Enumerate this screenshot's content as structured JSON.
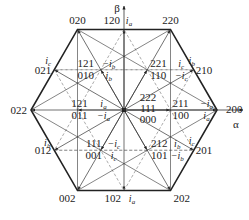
{
  "axes": {
    "alpha": "α",
    "beta": "β"
  },
  "colors": {
    "line": "#333333",
    "dashed": "#888888",
    "hexagon": "#222222"
  },
  "center_states": [
    "222",
    "111",
    "000"
  ],
  "large_vectors": [
    {
      "state": "200",
      "angle_deg": 0
    },
    {
      "state": "220",
      "angle_deg": 60
    },
    {
      "state": "020",
      "angle_deg": 120
    },
    {
      "state": "022",
      "angle_deg": 180
    },
    {
      "state": "002",
      "angle_deg": 240
    },
    {
      "state": "202",
      "angle_deg": 300
    }
  ],
  "medium_vectors": [
    {
      "state": "210",
      "angle_deg": 30,
      "current": "i",
      "current_sub": "b"
    },
    {
      "state": "120",
      "angle_deg": 90,
      "current": "i",
      "current_sub": "a"
    },
    {
      "state": "021",
      "angle_deg": 150,
      "current": "i",
      "current_sub": "c"
    },
    {
      "state": "012",
      "angle_deg": 210,
      "current": "i",
      "current_sub": "b"
    },
    {
      "state": "102",
      "angle_deg": 270,
      "current": "i",
      "current_sub": "a"
    },
    {
      "state": "201",
      "angle_deg": 330,
      "current": "i",
      "current_sub": "c"
    }
  ],
  "small_vectors": [
    {
      "top": "211",
      "bottom": "100",
      "angle_deg": 0,
      "top_current": "−i",
      "top_sub": "a",
      "bottom_current": "i",
      "bottom_sub": "a"
    },
    {
      "top": "221",
      "bottom": "110",
      "angle_deg": 60,
      "top_current": "i",
      "top_sub": "c",
      "bottom_current": "−i",
      "bottom_sub": "c"
    },
    {
      "top": "121",
      "bottom": "010",
      "angle_deg": 120,
      "top_current": "−i",
      "top_sub": "b",
      "bottom_current": "i",
      "bottom_sub": "b"
    },
    {
      "top": "121",
      "bottom": "011",
      "angle_deg": 180,
      "top_current": "i",
      "top_sub": "a",
      "bottom_current": "−i",
      "bottom_sub": "a"
    },
    {
      "top": "111",
      "bottom": "001",
      "angle_deg": 240,
      "top_current": "−i",
      "top_sub": "c",
      "bottom_current": "i",
      "bottom_sub": "c"
    },
    {
      "top": "212",
      "bottom": "101",
      "angle_deg": 300,
      "top_current": "i",
      "top_sub": "b",
      "bottom_current": "−i",
      "bottom_sub": "b"
    }
  ]
}
